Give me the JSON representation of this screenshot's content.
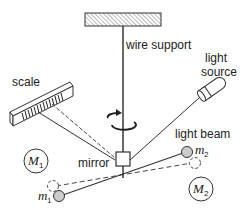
{
  "labels": {
    "wire_support": "wire support",
    "light_source_line1": "light",
    "light_source_line2": "source",
    "scale": "scale",
    "mirror": "mirror",
    "light_beam": "light beam",
    "M1_main": "M",
    "M1_sub": "1",
    "M2_main": "M",
    "M2_sub": "2",
    "m1_main": "m",
    "m1_sub": "1",
    "m2_main": "m",
    "m2_sub": "2"
  },
  "colors": {
    "line": "#333333",
    "small_mass_fill": "#cccccc",
    "hatch": "#555555"
  }
}
